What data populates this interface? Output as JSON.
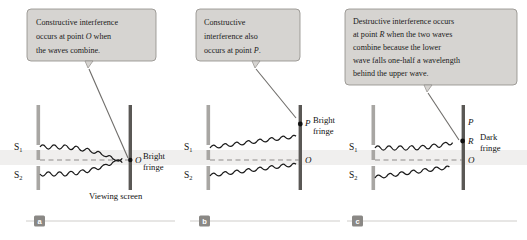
{
  "figure": {
    "band_color": "#f0efee",
    "callout_fill": "#d6d4d1",
    "callout_border": "#8e8b87",
    "barrier_color": "#a8a6a3",
    "screen_color": "#5a5855",
    "wave_color": "#1a1a1a",
    "leader_color": "#6f6d6a",
    "badge_fill": "#8a8885",
    "rule_color": "#cfcdca"
  },
  "panels": [
    {
      "id": "a",
      "badge": "a",
      "callout": {
        "lines": [
          [
            {
              "t": "Constructive interference",
              "style": "normal"
            }
          ],
          [
            {
              "t": "occurs at point ",
              "style": "normal"
            },
            {
              "t": "O",
              "style": "italic"
            },
            {
              "t": " when",
              "style": "normal"
            }
          ],
          [
            {
              "t": "the waves combine.",
              "style": "normal"
            }
          ]
        ]
      },
      "source_labels": [
        "S",
        "S"
      ],
      "source_subscripts": [
        "1",
        "2"
      ],
      "point_labels": [
        "O"
      ],
      "fringe_label": [
        "Bright",
        "fringe"
      ],
      "screen_label": "Viewing screen",
      "fringe_type": "bright"
    },
    {
      "id": "b",
      "badge": "b",
      "callout": {
        "lines": [
          [
            {
              "t": "Constructive",
              "style": "normal"
            }
          ],
          [
            {
              "t": "interference also",
              "style": "normal"
            }
          ],
          [
            {
              "t": "occurs at point ",
              "style": "normal"
            },
            {
              "t": "P",
              "style": "italic"
            },
            {
              "t": ".",
              "style": "normal"
            }
          ]
        ]
      },
      "source_labels": [
        "S",
        "S"
      ],
      "source_subscripts": [
        "1",
        "2"
      ],
      "point_labels": [
        "P",
        "O"
      ],
      "fringe_label": [
        "Bright",
        "fringe"
      ],
      "screen_label": "",
      "fringe_type": "bright"
    },
    {
      "id": "c",
      "badge": "c",
      "callout": {
        "lines": [
          [
            {
              "t": "Destructive interference occurs",
              "style": "normal"
            }
          ],
          [
            {
              "t": "at point ",
              "style": "normal"
            },
            {
              "t": "R",
              "style": "italic"
            },
            {
              "t": " when the two waves",
              "style": "normal"
            }
          ],
          [
            {
              "t": "combine because the lower",
              "style": "normal"
            }
          ],
          [
            {
              "t": "wave falls one-half a wavelength",
              "style": "normal"
            }
          ],
          [
            {
              "t": "behind the upper wave.",
              "style": "normal"
            }
          ]
        ]
      },
      "source_labels": [
        "S",
        "S"
      ],
      "source_subscripts": [
        "1",
        "2"
      ],
      "point_labels": [
        "P",
        "R",
        "O"
      ],
      "fringe_label": [
        "Dark",
        "fringe"
      ],
      "screen_label": "",
      "fringe_type": "dark"
    }
  ]
}
